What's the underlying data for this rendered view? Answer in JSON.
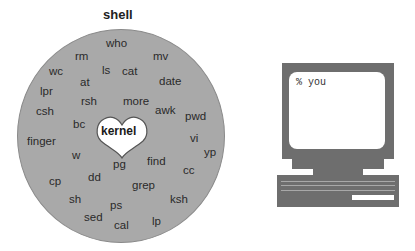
{
  "diagram": {
    "title": "shell",
    "center_label": "kernel",
    "center_shape": "heart",
    "commands": [
      {
        "label": "who",
        "x": 106,
        "y": 37
      },
      {
        "label": "rm",
        "x": 75,
        "y": 50
      },
      {
        "label": "mv",
        "x": 153,
        "y": 50
      },
      {
        "label": "wc",
        "x": 49,
        "y": 65
      },
      {
        "label": "ls",
        "x": 102,
        "y": 64
      },
      {
        "label": "cat",
        "x": 122,
        "y": 65
      },
      {
        "label": "at",
        "x": 80,
        "y": 76
      },
      {
        "label": "date",
        "x": 159,
        "y": 75
      },
      {
        "label": "lpr",
        "x": 40,
        "y": 85
      },
      {
        "label": "rsh",
        "x": 81,
        "y": 95
      },
      {
        "label": "more",
        "x": 123,
        "y": 95
      },
      {
        "label": "csh",
        "x": 36,
        "y": 105
      },
      {
        "label": "awk",
        "x": 155,
        "y": 104
      },
      {
        "label": "pwd",
        "x": 185,
        "y": 110
      },
      {
        "label": "bc",
        "x": 73,
        "y": 118
      },
      {
        "label": "vi",
        "x": 190,
        "y": 132
      },
      {
        "label": "finger",
        "x": 27,
        "y": 135
      },
      {
        "label": "yp",
        "x": 204,
        "y": 146
      },
      {
        "label": "w",
        "x": 72,
        "y": 149
      },
      {
        "label": "pg",
        "x": 113,
        "y": 158
      },
      {
        "label": "find",
        "x": 147,
        "y": 155
      },
      {
        "label": "cc",
        "x": 183,
        "y": 164
      },
      {
        "label": "cp",
        "x": 49,
        "y": 175
      },
      {
        "label": "dd",
        "x": 88,
        "y": 171
      },
      {
        "label": "grep",
        "x": 132,
        "y": 179
      },
      {
        "label": "sh",
        "x": 69,
        "y": 193
      },
      {
        "label": "ps",
        "x": 110,
        "y": 199
      },
      {
        "label": "ksh",
        "x": 170,
        "y": 193
      },
      {
        "label": "sed",
        "x": 84,
        "y": 211
      },
      {
        "label": "cal",
        "x": 114,
        "y": 219
      },
      {
        "label": "lp",
        "x": 152,
        "y": 215
      }
    ],
    "terminal": {
      "prompt_text": "% you"
    }
  },
  "colors": {
    "shell_fill": "#a9a9a9",
    "computer_fill": "#6e6e6e",
    "screen_fill": "#ffffff",
    "text": "#2a2a2a"
  }
}
